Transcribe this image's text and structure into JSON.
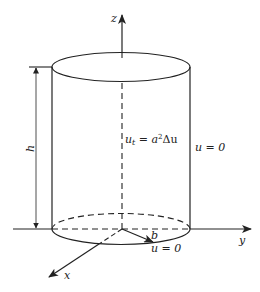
{
  "figure": {
    "type": "cylinder-heat-equation-diagram",
    "axes": {
      "x_label": "x",
      "y_label": "y",
      "z_label": "z"
    },
    "dimensions": {
      "height_label": "h",
      "radius_label": "b"
    },
    "equations": {
      "interior_pde": {
        "lhs_var": "u",
        "lhs_sub": "t",
        "equals": " = ",
        "rhs_coef": "a",
        "rhs_exp": "2",
        "rhs_op": "Δu"
      },
      "lateral_bc": "u = 0",
      "bottom_bc": "u = 0"
    },
    "colors": {
      "stroke": "#222222",
      "background": "#ffffff"
    }
  }
}
